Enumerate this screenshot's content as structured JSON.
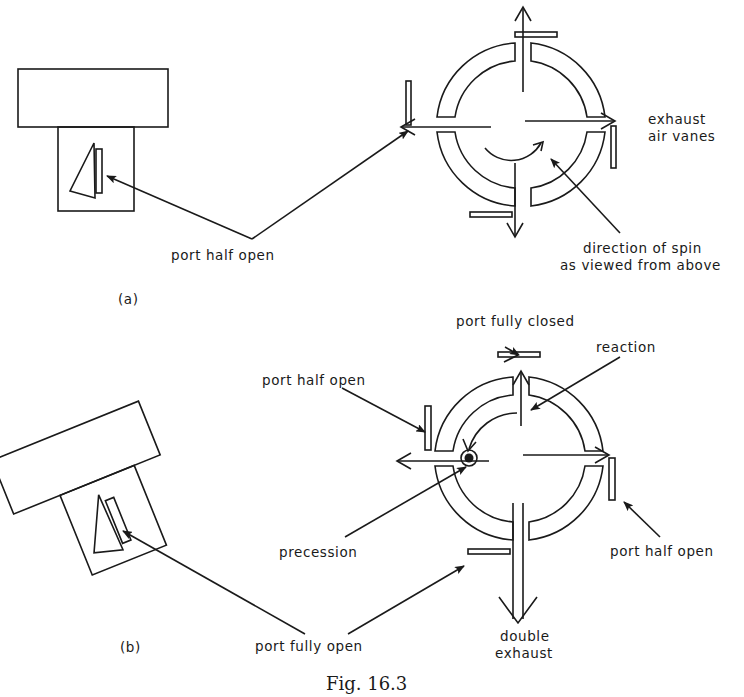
{
  "figure": {
    "caption": "Fig. 16.3",
    "panel_a": {
      "label": "(a)",
      "labels": {
        "port_half_open": "port half open",
        "exhaust_line1": "exhaust",
        "exhaust_line2": "air vanes",
        "spin_line1": "direction of spin",
        "spin_line2": "as viewed from above"
      }
    },
    "panel_b": {
      "label": "(b)",
      "labels": {
        "port_fully_closed": "port fully closed",
        "reaction": "reaction",
        "port_half_open_left": "port half open",
        "precession": "precession",
        "port_half_open_right": "port half open",
        "port_fully_open": "port fully open",
        "double_line1": "double",
        "double_line2": "exhaust"
      }
    }
  }
}
